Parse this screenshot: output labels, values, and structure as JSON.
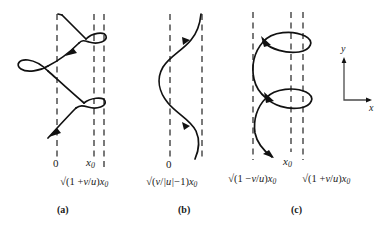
{
  "figure": {
    "axis_key": {
      "y_label": "y",
      "x_label": "x",
      "name": "coordinate-axes-key"
    },
    "panels": [
      {
        "id": "a",
        "caption": "(a)",
        "type": "prolate-trochoid",
        "origin_label": "0",
        "x0_label": "x₀",
        "equation_label": "√(1 + v/u)x₀",
        "equation_parts": {
          "radical": "√",
          "open": "(1 +",
          "numerator": "v",
          "slash": "/",
          "denominator": "u",
          "close": ")",
          "variable": "x",
          "subscript": "0"
        },
        "dashed_lines": 3,
        "loops": 3,
        "arrows": 2
      },
      {
        "id": "b",
        "caption": "(b)",
        "type": "sinusoid",
        "origin_label": "0",
        "equation_label": "√(v/|u|−1)x₀",
        "equation_parts": {
          "radical": "√",
          "open": "(",
          "numerator": "v",
          "slash": "/",
          "denominator": "|u|",
          "minus_one": "−1)",
          "variable": "x",
          "subscript": "0"
        },
        "dashed_lines": 2,
        "loops": 0,
        "arrows": 2
      },
      {
        "id": "c",
        "caption": "(c)",
        "type": "curtate-trochoid",
        "x0_label": "x₀",
        "equation_left": "√(1 − v/u)x₀",
        "equation_right": "√(1 + v/u)x₀",
        "equation_left_parts": {
          "radical": "√",
          "open": "(1 −",
          "numerator": "v",
          "slash": "/",
          "denominator": "u",
          "close": ")",
          "variable": "x",
          "subscript": "0"
        },
        "equation_right_parts": {
          "radical": "√",
          "open": "(1 +",
          "numerator": "v",
          "slash": "/",
          "denominator": "u",
          "close": ")",
          "variable": "x",
          "subscript": "0"
        },
        "dashed_lines": 3,
        "loops": 2,
        "arrows": 2
      }
    ],
    "colors": {
      "ink": "#1a1a1a",
      "curve": "#111111",
      "dashed": "#2a2a2a",
      "background": "#ffffff"
    }
  }
}
